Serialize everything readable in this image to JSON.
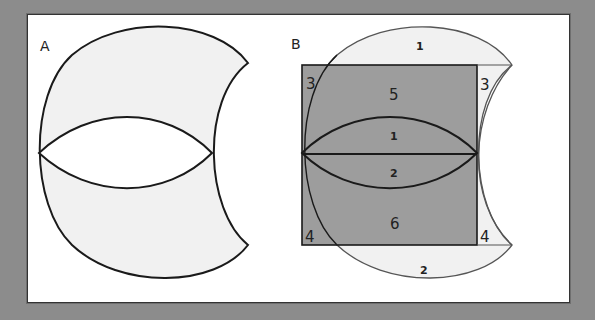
{
  "figure": {
    "panels": [
      {
        "id": "A",
        "label": "A",
        "description": "Crescent-like shape with a lens cut out of the middle"
      },
      {
        "id": "B",
        "label": "B",
        "description": "Same shape overlaid on a shaded rectangle, regions numbered",
        "regions": {
          "top_cap": "1",
          "bottom_cap": "2",
          "top_left_corner": "3",
          "top_right_corner": "3",
          "bottom_left_corner": "4",
          "bottom_right_corner": "4",
          "upper_rect": "5",
          "lower_rect": "6",
          "upper_lens": "1",
          "lower_lens": "2"
        }
      }
    ],
    "colors": {
      "background": "#8c8c8c",
      "panel": "#ffffff",
      "light_fill": "#f1f1f1",
      "rect_fill": "#9d9d9d",
      "stroke": "#1a1a1a"
    }
  }
}
